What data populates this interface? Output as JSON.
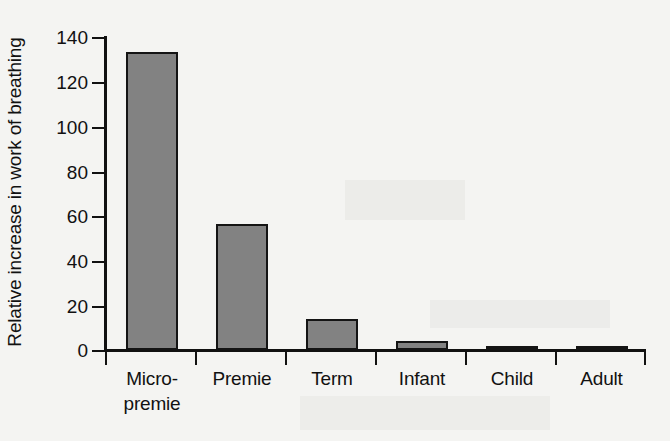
{
  "chart_data": {
    "type": "bar",
    "title": "",
    "xlabel": "",
    "ylabel": "Relative increase in work of breathing",
    "categories": [
      "Micro-premie",
      "Premie",
      "Term",
      "Infant",
      "Child",
      "Adult"
    ],
    "category_lines": [
      [
        "Micro-",
        "premie"
      ],
      [
        "Premie"
      ],
      [
        "Term"
      ],
      [
        "Infant"
      ],
      [
        "Child"
      ],
      [
        "Adult"
      ]
    ],
    "values": [
      133,
      56,
      14,
      4,
      2,
      1
    ],
    "ylim": [
      0,
      140
    ],
    "yticks": [
      0,
      20,
      40,
      60,
      80,
      100,
      120,
      140
    ],
    "ytick_labels": [
      "0",
      "20",
      "40",
      "60",
      "80",
      "100",
      "120",
      "140"
    ],
    "grid": false,
    "legend": null,
    "bar_fill_color": "#828282",
    "bar_border_color": "#141414",
    "axis_color": "#111111",
    "background_color": "#f4f4f2"
  }
}
